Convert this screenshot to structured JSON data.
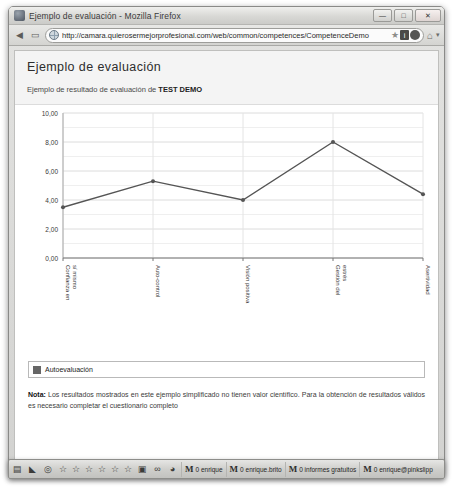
{
  "window": {
    "title": "Ejemplo de evaluación - Mozilla Firefox",
    "icon": "firefox-icon",
    "minimize_label": "—",
    "maximize_label": "□",
    "close_label": "✕"
  },
  "navbar": {
    "back_icon": "back-arrow-icon",
    "forward_icon": "forward-arrow-icon",
    "url": "http://camara.quierosermejorprofesional.com/web/common/competences/CompetenceDemo",
    "star_icon": "★",
    "info_icon": "i",
    "reader_icon": "reader-icon",
    "home_icon": "⌂",
    "caret": "▾"
  },
  "page": {
    "title": "Ejemplo de evaluación",
    "subtitle_prefix": "Ejemplo de resultado de evaluación de ",
    "subtitle_strong": "TEST DEMO",
    "note_label": "Nota:",
    "note_text": " Los resultados mostrados en este ejemplo simplificado no tienen valor científico. Para la obtención de resultados válidos es necesario completar el cuestionario completo"
  },
  "chart_data": {
    "type": "line",
    "title": "",
    "xlabel": "",
    "ylabel": "",
    "ylim": [
      0,
      10
    ],
    "yticks": [
      "0,00",
      "2,00",
      "4,00",
      "6,00",
      "8,00",
      "10,00"
    ],
    "ytick_values": [
      0,
      2,
      4,
      6,
      8,
      10
    ],
    "grid": true,
    "legend_position": "bottom",
    "categories": [
      "Confianza en sí mismo",
      "Auto-control",
      "Visión positiva",
      "Gestión del estrés",
      "Asertividad"
    ],
    "series": [
      {
        "name": "Autoevaluación",
        "color": "#555555",
        "values": [
          3.5,
          5.3,
          4.0,
          8.0,
          4.4
        ]
      }
    ]
  },
  "taskbar": {
    "icons": [
      "notes-icon",
      "triangle-icon",
      "clock-icon",
      "star-icon",
      "star-icon",
      "star-icon",
      "star-icon",
      "star-icon",
      "star-icon",
      "mail-badge-icon",
      "link-icon",
      "shield-icon"
    ],
    "tasks": [
      {
        "icon": "gmail-icon",
        "label": "0 enrique"
      },
      {
        "icon": "gmail-icon",
        "label": "0 enrique.brito"
      },
      {
        "icon": "gmail-icon",
        "label": "0 informes gratuitos"
      },
      {
        "icon": "gmail-icon",
        "label": "0 enrique@pinkslipp"
      }
    ]
  }
}
